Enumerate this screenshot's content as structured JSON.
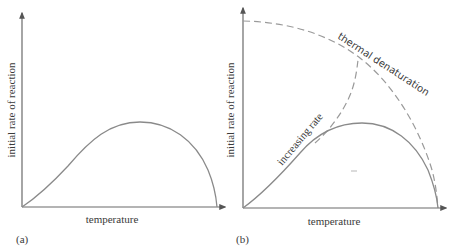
{
  "panels": [
    {
      "id": "a",
      "label": "(a)",
      "xlabel": "temperature",
      "ylabel": "initial rate of reaction",
      "curves": [
        {
          "name": "observed rate",
          "style": "solid"
        }
      ]
    },
    {
      "id": "b",
      "label": "(b)",
      "xlabel": "temperature",
      "ylabel": "initial rate of reaction",
      "curves": [
        {
          "name": "observed rate",
          "style": "solid"
        },
        {
          "name": "increasing rate",
          "style": "dashed",
          "annotation": "increasing rate"
        },
        {
          "name": "thermal denaturation",
          "style": "dashed",
          "annotation": "thermal denaturation"
        }
      ]
    }
  ],
  "colors": {
    "axis": "#6a6a6a",
    "curve": "#8a8a8a",
    "dashed": "#9a9a9a",
    "text": "#3a3a3a"
  }
}
